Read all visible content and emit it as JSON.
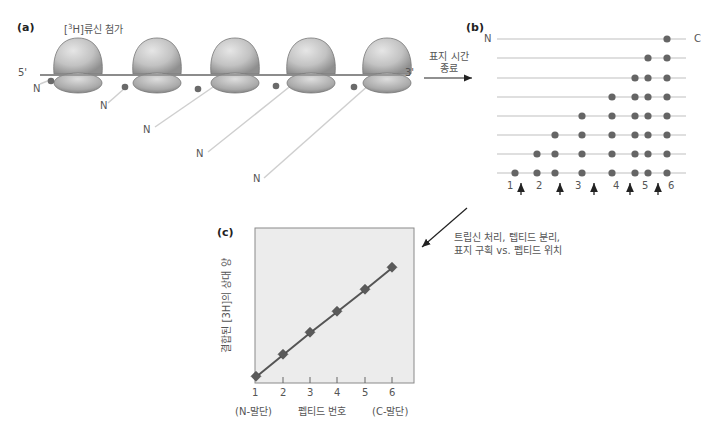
{
  "panel_a": {
    "label": "(a)",
    "title": "[3H]류신 첨가",
    "title_pre": "[",
    "title_sup": "3",
    "title_post": "H]류신 첨가",
    "five_prime": "5'",
    "three_prime": "3'",
    "n_label": "N",
    "ribosome_count": 5
  },
  "arrow_ab": {
    "line1": "표지 시간",
    "line2": "종료"
  },
  "panel_b": {
    "label": "(b)",
    "n_label": "N",
    "c_label": "C",
    "rows": [
      [
        6
      ],
      [
        5,
        6
      ],
      [
        4,
        5,
        6
      ],
      [
        3,
        4,
        5,
        6
      ],
      [
        2,
        3,
        4,
        5,
        6
      ],
      [
        1,
        2,
        3,
        4,
        5,
        6
      ],
      [
        0,
        1,
        2,
        3,
        4,
        5,
        6
      ],
      [
        -1,
        0,
        1,
        2,
        3,
        4,
        5,
        6
      ]
    ],
    "peptide_numbers": [
      "1",
      "2",
      "3",
      "4",
      "5",
      "6"
    ]
  },
  "arrow_bc": {
    "line1": "트립신 처리, 텝티드 분리,",
    "line2": "표지 구획 vs. 펩티드 위치"
  },
  "panel_c": {
    "label": "(c)",
    "ylabel": "결합된 [3H]의 상대 양",
    "xlabel": "펩티드 번호",
    "x_left_note": "(N-말단)",
    "x_right_note": "(C-말단)"
  },
  "chart_data": {
    "type": "line",
    "title": "",
    "xlabel": "펩티드 번호",
    "ylabel": "결합된 [3H]의 상대 양",
    "categories": [
      "1",
      "2",
      "3",
      "4",
      "5",
      "6"
    ],
    "x": [
      1,
      2,
      3,
      4,
      5,
      6
    ],
    "values": [
      0,
      1,
      2,
      3,
      4,
      5
    ],
    "annotations": [
      "(N-말단)",
      "(C-말단)"
    ],
    "grid": false,
    "legend": null
  }
}
